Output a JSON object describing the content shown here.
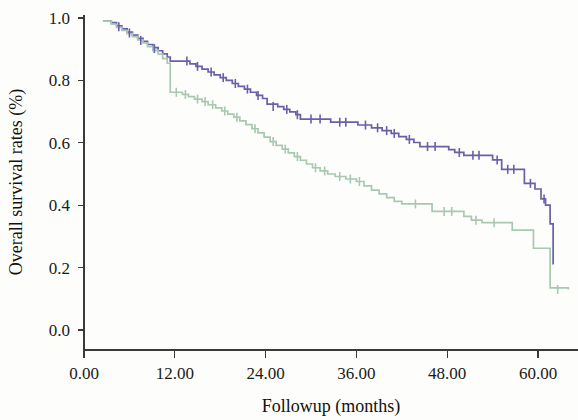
{
  "chart_data": {
    "type": "line",
    "title": "",
    "subtitle": "",
    "xlabel": "Followup (months)",
    "ylabel": "Overall survival rates (%)",
    "xlim": [
      0,
      64.5
    ],
    "ylim": [
      0.0,
      1.05
    ],
    "xticks": [
      0,
      12,
      24,
      36,
      48,
      60
    ],
    "xticklabels": [
      "0.00",
      "12.00",
      "24.00",
      "36.00",
      "48.00",
      "60.00"
    ],
    "yticks": [
      0.0,
      0.2,
      0.4,
      0.6,
      0.8,
      1.0
    ],
    "yticklabels": [
      "0.0",
      "0.2",
      "0.4",
      "0.6",
      "0.8",
      "1.0"
    ],
    "grid": false,
    "legend": null,
    "legend_position": "none",
    "plot_style": "kaplan-meier step function with censoring tick marks",
    "series": [
      {
        "name": "group-1-upper-curve",
        "color": "#6a5fa8",
        "step": "post",
        "points": [
          [
            2.5,
            0.99
          ],
          [
            3.6,
            0.985
          ],
          [
            4.3,
            0.975
          ],
          [
            5.0,
            0.965
          ],
          [
            5.7,
            0.955
          ],
          [
            6.4,
            0.945
          ],
          [
            7.1,
            0.935
          ],
          [
            7.8,
            0.925
          ],
          [
            8.4,
            0.915
          ],
          [
            9.1,
            0.905
          ],
          [
            9.8,
            0.895
          ],
          [
            10.4,
            0.885
          ],
          [
            11.0,
            0.875
          ],
          [
            11.4,
            0.862
          ],
          [
            13.2,
            0.862
          ],
          [
            14.0,
            0.853
          ],
          [
            14.8,
            0.845
          ],
          [
            15.6,
            0.836
          ],
          [
            16.4,
            0.827
          ],
          [
            17.2,
            0.818
          ],
          [
            18.0,
            0.809
          ],
          [
            18.8,
            0.8
          ],
          [
            19.6,
            0.79
          ],
          [
            20.4,
            0.781
          ],
          [
            21.2,
            0.772
          ],
          [
            22.0,
            0.762
          ],
          [
            22.8,
            0.752
          ],
          [
            23.6,
            0.742
          ],
          [
            24.2,
            0.724
          ],
          [
            25.6,
            0.716
          ],
          [
            26.4,
            0.707
          ],
          [
            27.2,
            0.699
          ],
          [
            28.0,
            0.69
          ],
          [
            28.6,
            0.676
          ],
          [
            31.8,
            0.676
          ],
          [
            32.6,
            0.666
          ],
          [
            35.0,
            0.666
          ],
          [
            36.2,
            0.657
          ],
          [
            38.0,
            0.648
          ],
          [
            39.4,
            0.639
          ],
          [
            40.6,
            0.63
          ],
          [
            41.6,
            0.62
          ],
          [
            42.6,
            0.611
          ],
          [
            43.6,
            0.601
          ],
          [
            44.4,
            0.588
          ],
          [
            47.2,
            0.588
          ],
          [
            48.2,
            0.578
          ],
          [
            49.0,
            0.569
          ],
          [
            50.2,
            0.56
          ],
          [
            53.0,
            0.56
          ],
          [
            54.0,
            0.545
          ],
          [
            55.2,
            0.515
          ],
          [
            57.4,
            0.515
          ],
          [
            58.2,
            0.47
          ],
          [
            59.6,
            0.452
          ],
          [
            60.4,
            0.42
          ],
          [
            61.0,
            0.4
          ],
          [
            61.6,
            0.34
          ],
          [
            62.0,
            0.21
          ]
        ],
        "censor_points": [
          [
            4.6,
            0.972
          ],
          [
            6.0,
            0.952
          ],
          [
            7.5,
            0.928
          ],
          [
            9.3,
            0.902
          ],
          [
            13.6,
            0.862
          ],
          [
            15.0,
            0.845
          ],
          [
            16.8,
            0.827
          ],
          [
            18.4,
            0.809
          ],
          [
            20.0,
            0.79
          ],
          [
            21.6,
            0.772
          ],
          [
            23.0,
            0.752
          ],
          [
            25.0,
            0.716
          ],
          [
            26.8,
            0.707
          ],
          [
            28.2,
            0.69
          ],
          [
            30.0,
            0.676
          ],
          [
            31.2,
            0.676
          ],
          [
            33.8,
            0.666
          ],
          [
            34.6,
            0.666
          ],
          [
            37.2,
            0.657
          ],
          [
            38.8,
            0.648
          ],
          [
            40.0,
            0.639
          ],
          [
            41.0,
            0.63
          ],
          [
            43.0,
            0.611
          ],
          [
            45.4,
            0.588
          ],
          [
            46.4,
            0.588
          ],
          [
            49.6,
            0.569
          ],
          [
            51.4,
            0.56
          ],
          [
            52.2,
            0.56
          ],
          [
            54.6,
            0.545
          ],
          [
            56.0,
            0.515
          ],
          [
            56.8,
            0.515
          ],
          [
            59.0,
            0.47
          ],
          [
            60.8,
            0.42
          ]
        ]
      },
      {
        "name": "group-2-lower-curve",
        "color": "#a8c8b0",
        "step": "post",
        "points": [
          [
            2.5,
            0.99
          ],
          [
            3.6,
            0.98
          ],
          [
            4.3,
            0.97
          ],
          [
            5.0,
            0.96
          ],
          [
            5.7,
            0.95
          ],
          [
            6.4,
            0.94
          ],
          [
            7.1,
            0.93
          ],
          [
            7.8,
            0.92
          ],
          [
            8.4,
            0.908
          ],
          [
            9.1,
            0.896
          ],
          [
            9.8,
            0.884
          ],
          [
            10.4,
            0.87
          ],
          [
            11.0,
            0.855
          ],
          [
            11.4,
            0.762
          ],
          [
            13.0,
            0.755
          ],
          [
            13.8,
            0.748
          ],
          [
            14.6,
            0.74
          ],
          [
            15.6,
            0.732
          ],
          [
            16.4,
            0.722
          ],
          [
            17.4,
            0.712
          ],
          [
            18.2,
            0.702
          ],
          [
            19.0,
            0.692
          ],
          [
            19.8,
            0.682
          ],
          [
            20.6,
            0.67
          ],
          [
            21.4,
            0.658
          ],
          [
            22.2,
            0.645
          ],
          [
            23.0,
            0.632
          ],
          [
            23.8,
            0.618
          ],
          [
            24.6,
            0.604
          ],
          [
            25.4,
            0.592
          ],
          [
            26.2,
            0.58
          ],
          [
            27.0,
            0.568
          ],
          [
            27.8,
            0.556
          ],
          [
            28.6,
            0.544
          ],
          [
            29.4,
            0.532
          ],
          [
            30.2,
            0.52
          ],
          [
            31.2,
            0.51
          ],
          [
            32.2,
            0.5
          ],
          [
            33.2,
            0.492
          ],
          [
            34.6,
            0.484
          ],
          [
            36.0,
            0.476
          ],
          [
            37.0,
            0.462
          ],
          [
            38.0,
            0.448
          ],
          [
            39.0,
            0.436
          ],
          [
            40.0,
            0.424
          ],
          [
            41.0,
            0.412
          ],
          [
            42.0,
            0.404
          ],
          [
            45.0,
            0.404
          ],
          [
            46.0,
            0.38
          ],
          [
            49.4,
            0.38
          ],
          [
            50.2,
            0.364
          ],
          [
            51.2,
            0.352
          ],
          [
            52.6,
            0.344
          ],
          [
            55.8,
            0.344
          ],
          [
            56.6,
            0.32
          ],
          [
            58.6,
            0.32
          ],
          [
            59.4,
            0.262
          ],
          [
            61.0,
            0.262
          ],
          [
            61.6,
            0.135
          ],
          [
            64.0,
            0.13
          ]
        ],
        "censor_points": [
          [
            12.2,
            0.762
          ],
          [
            13.4,
            0.755
          ],
          [
            15.0,
            0.74
          ],
          [
            16.0,
            0.732
          ],
          [
            17.0,
            0.722
          ],
          [
            18.6,
            0.702
          ],
          [
            20.2,
            0.682
          ],
          [
            22.6,
            0.645
          ],
          [
            25.0,
            0.604
          ],
          [
            26.6,
            0.58
          ],
          [
            28.2,
            0.556
          ],
          [
            30.6,
            0.52
          ],
          [
            31.8,
            0.51
          ],
          [
            33.8,
            0.492
          ],
          [
            35.2,
            0.484
          ],
          [
            36.4,
            0.476
          ],
          [
            43.8,
            0.404
          ],
          [
            47.6,
            0.38
          ],
          [
            48.6,
            0.38
          ],
          [
            51.8,
            0.352
          ],
          [
            54.2,
            0.344
          ],
          [
            62.6,
            0.13
          ]
        ]
      }
    ]
  },
  "axes": {
    "x_title": "Followup (months)",
    "y_title": "Overall survival rates (%)"
  }
}
